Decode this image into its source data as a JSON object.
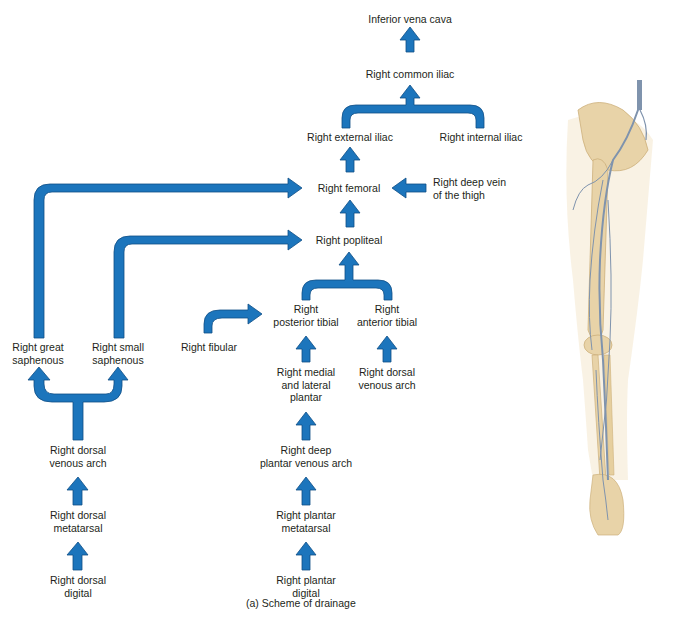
{
  "diagram": {
    "caption": "(a) Scheme of drainage",
    "arrow_color": "#1c75bc",
    "arrow_outline": "#0f4e85",
    "nodes": {
      "ivc": "Inferior vena cava",
      "common_iliac": "Right common iliac",
      "external_iliac": "Right external iliac",
      "internal_iliac": "Right internal iliac",
      "femoral": "Right femoral",
      "deep_vein_thigh_1": "Right deep vein",
      "deep_vein_thigh_2": "of the thigh",
      "popliteal": "Right popliteal",
      "posterior_tibial_1": "Right",
      "posterior_tibial_2": "posterior tibial",
      "anterior_tibial_1": "Right",
      "anterior_tibial_2": "anterior tibial",
      "fibular": "Right fibular",
      "great_saphenous_1": "Right great",
      "great_saphenous_2": "saphenous",
      "small_saphenous_1": "Right small",
      "small_saphenous_2": "saphenous",
      "medial_lateral_plantar_1": "Right medial",
      "medial_lateral_plantar_2": "and lateral",
      "medial_lateral_plantar_3": "plantar",
      "dorsal_venous_arch_ant_1": "Right dorsal",
      "dorsal_venous_arch_ant_2": "venous arch",
      "dorsal_venous_arch_1": "Right dorsal",
      "dorsal_venous_arch_2": "venous arch",
      "dorsal_metatarsal_1": "Right dorsal",
      "dorsal_metatarsal_2": "metatarsal",
      "dorsal_digital_1": "Right dorsal",
      "dorsal_digital_2": "digital",
      "deep_plantar_arch_1": "Right deep",
      "deep_plantar_arch_2": "plantar venous arch",
      "plantar_metatarsal_1": "Right plantar",
      "plantar_metatarsal_2": "metatarsal",
      "plantar_digital_1": "Right plantar",
      "plantar_digital_2": "digital"
    },
    "illustration": {
      "label": "leg-venous-anatomy-illustration",
      "bone_color": "#e8d3a8",
      "vein_color": "#7f93ad"
    }
  }
}
